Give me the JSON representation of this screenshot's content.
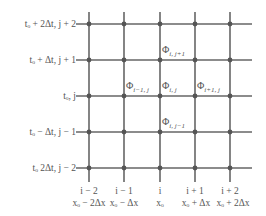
{
  "grid": {
    "columns_x": [
      89,
      124,
      160,
      195,
      230
    ],
    "rows_y": [
      24,
      60,
      96,
      132,
      168
    ],
    "line_color": "#666666",
    "node_color": "#555555"
  },
  "row_labels": [
    {
      "text": "tₒ + 2Δt, j + 2"
    },
    {
      "text": "tₒ + Δt, j + 1"
    },
    {
      "text": "tₒ, j"
    },
    {
      "text": "tₒ − Δt, j − 1"
    },
    {
      "text": "tₒ   2Δt, j − 2"
    }
  ],
  "column_labels": [
    {
      "index": "i − 2",
      "coord": "xₒ − 2Δx"
    },
    {
      "index": "i − 1",
      "coord": "xₒ − Δx"
    },
    {
      "index": "i",
      "coord": "xₒ"
    },
    {
      "index": "i + 1",
      "coord": "xₒ + Δx"
    },
    {
      "index": "i + 2",
      "coord": "xₒ + 2Δx"
    }
  ],
  "node_labels": [
    {
      "symbol": "Φ",
      "sub": "i, j+1"
    },
    {
      "symbol": "Φ",
      "sub": "i−1, j"
    },
    {
      "symbol": "Φ",
      "sub": "i, j"
    },
    {
      "symbol": "Φ",
      "sub": "i+1, j"
    },
    {
      "symbol": "Φ",
      "sub": "i, j−1"
    }
  ]
}
